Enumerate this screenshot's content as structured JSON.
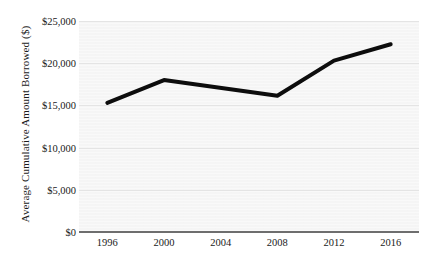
{
  "chart_data": {
    "type": "line",
    "title": "",
    "xlabel": "",
    "ylabel": "Average Cumulative Amount Borrowed ($)",
    "x": [
      1996,
      2000,
      2004,
      2008,
      2012,
      2016
    ],
    "categories": [
      "1996",
      "2000",
      "2004",
      "2008",
      "2012",
      "2016"
    ],
    "series": [
      {
        "name": "Average Cumulative Amount Borrowed",
        "values": [
          15300,
          18000,
          17100,
          16150,
          20300,
          22250
        ],
        "color": "#0d0d0d"
      }
    ],
    "vertices": [
      {
        "x": 1996,
        "y": 15300
      },
      {
        "x": 2000,
        "y": 18000
      },
      {
        "x": 2008,
        "y": 16150
      },
      {
        "x": 2012,
        "y": 20300
      },
      {
        "x": 2016,
        "y": 22250
      }
    ],
    "xlim": [
      1994,
      2018
    ],
    "ylim": [
      0,
      25000
    ],
    "yticks": [
      0,
      5000,
      10000,
      15000,
      20000,
      25000
    ],
    "ytick_labels": [
      "$0",
      "$5,000",
      "$10,000",
      "$15,000",
      "$20,000",
      "$25,000"
    ],
    "xticks": [
      1996,
      2000,
      2004,
      2008,
      2012,
      2016
    ],
    "xtick_labels": [
      "1996",
      "2000",
      "2004",
      "2008",
      "2012",
      "2016"
    ],
    "grid": "horizontal",
    "legend": "none",
    "plot_background_color": "#f4f4f4",
    "gridline_color": "#e4e4e4",
    "axis_line_color": "#6e6e6e",
    "line_width_px": 4
  }
}
